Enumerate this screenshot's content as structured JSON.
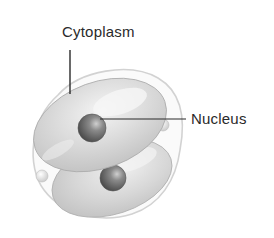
{
  "diagram": {
    "labels": [
      {
        "id": "cytoplasm",
        "text": "Cytoplasm",
        "points_to": "upper cell cytoplasm"
      },
      {
        "id": "nucleus",
        "text": "Nucleus",
        "points_to": "upper cell nucleus"
      }
    ],
    "colors": {
      "background": "#ffffff",
      "membrane_outline": "#d4d4d4",
      "cell_fill": "#d9d9d9",
      "cell_highlight": "#f2f2f2",
      "nucleus_fill": "#6e6e6e",
      "leader_line": "#2a2a2a",
      "text": "#2a2a2a"
    }
  }
}
